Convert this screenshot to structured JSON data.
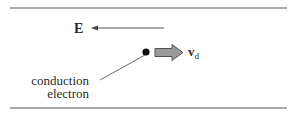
{
  "diagram": {
    "field_label": "E",
    "velocity_label": "v",
    "velocity_subscript": "d",
    "particle_label_line1": "conduction",
    "particle_label_line2": "electron",
    "colors": {
      "line": "#555555",
      "text": "#2a2a2a",
      "block_arrow_fill": "#9a9a9a",
      "block_arrow_stroke": "#555555",
      "dot": "#111111"
    }
  }
}
